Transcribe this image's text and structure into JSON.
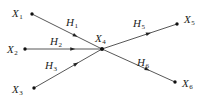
{
  "diagram": {
    "type": "directed-graph",
    "nodes": [
      {
        "id": "X1",
        "base": "X",
        "sub": "1",
        "x": 32,
        "y": 14,
        "label_x": 12,
        "label_y": 17
      },
      {
        "id": "X2",
        "base": "X",
        "sub": "2",
        "x": 25,
        "y": 49,
        "label_x": 7,
        "label_y": 53
      },
      {
        "id": "X3",
        "base": "X",
        "sub": "3",
        "x": 34,
        "y": 88,
        "label_x": 12,
        "label_y": 93
      },
      {
        "id": "X4",
        "base": "X",
        "sub": "4",
        "x": 102,
        "y": 49,
        "label_x": 95,
        "label_y": 42
      },
      {
        "id": "X5",
        "base": "X",
        "sub": "5",
        "x": 177,
        "y": 24,
        "label_x": 184,
        "label_y": 23
      },
      {
        "id": "X6",
        "base": "X",
        "sub": "6",
        "x": 175,
        "y": 82,
        "label_x": 182,
        "label_y": 87
      }
    ],
    "edges": [
      {
        "id": "H1",
        "base": "H",
        "sub": "1",
        "from": "X1",
        "to": "X4",
        "label_x": 66,
        "label_y": 26
      },
      {
        "id": "H2",
        "base": "H",
        "sub": "2",
        "from": "X2",
        "to": "X4",
        "label_x": 50,
        "label_y": 45
      },
      {
        "id": "H3",
        "base": "H",
        "sub": "3",
        "from": "X3",
        "to": "X4",
        "label_x": 45,
        "label_y": 69
      },
      {
        "id": "H5",
        "base": "H",
        "sub": "5",
        "from": "X4",
        "to": "X5",
        "label_x": 133,
        "label_y": 27
      },
      {
        "id": "H6",
        "base": "H",
        "sub": "6",
        "from": "X4",
        "to": "X6",
        "label_x": 137,
        "label_y": 66
      }
    ]
  }
}
